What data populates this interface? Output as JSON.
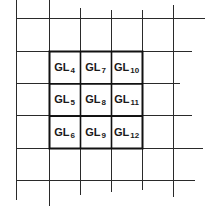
{
  "diagram": {
    "type": "grid",
    "colors": {
      "background": "#ffffff",
      "grid_line": "#2a2a2a",
      "bold_line": "#111111",
      "text": "#1a1a1a"
    },
    "grid": {
      "vertical_lines": [
        {
          "x": 16,
          "y1": 0,
          "y2": 200
        },
        {
          "x": 49,
          "y1": 0,
          "y2": 206
        },
        {
          "x": 80,
          "y1": 8,
          "y2": 195
        },
        {
          "x": 111,
          "y1": 10,
          "y2": 192
        },
        {
          "x": 142,
          "y1": 10,
          "y2": 190
        },
        {
          "x": 173,
          "y1": 5,
          "y2": 197
        }
      ],
      "horizontal_lines": [
        {
          "y": 18,
          "x1": 16,
          "x2": 205
        },
        {
          "y": 51,
          "x1": 16,
          "x2": 192
        },
        {
          "y": 83,
          "x1": 16,
          "x2": 180
        },
        {
          "y": 115,
          "x1": 16,
          "x2": 192
        },
        {
          "y": 148,
          "x1": 16,
          "x2": 203
        },
        {
          "y": 180,
          "x1": 16,
          "x2": 195
        }
      ]
    },
    "highlight_block": {
      "x": 49,
      "y": 51,
      "width": 93,
      "height": 97
    },
    "cells": [
      {
        "id": "gl4",
        "base": "GL",
        "sub": "4",
        "row": 0,
        "col": 0
      },
      {
        "id": "gl7",
        "base": "GL",
        "sub": "7",
        "row": 0,
        "col": 1
      },
      {
        "id": "gl10",
        "base": "GL",
        "sub": "10",
        "row": 0,
        "col": 2
      },
      {
        "id": "gl5",
        "base": "GL",
        "sub": "5",
        "row": 1,
        "col": 0
      },
      {
        "id": "gl8",
        "base": "GL",
        "sub": "8",
        "row": 1,
        "col": 1
      },
      {
        "id": "gl11",
        "base": "GL",
        "sub": "11",
        "row": 1,
        "col": 2
      },
      {
        "id": "gl6",
        "base": "GL",
        "sub": "6",
        "row": 2,
        "col": 0
      },
      {
        "id": "gl9",
        "base": "GL",
        "sub": "9",
        "row": 2,
        "col": 1
      },
      {
        "id": "gl12",
        "base": "GL",
        "sub": "12",
        "row": 2,
        "col": 2
      }
    ]
  }
}
